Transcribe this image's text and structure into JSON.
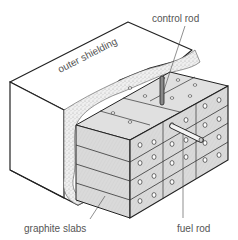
{
  "diagram": {
    "labels": {
      "control_rod": "control rod",
      "outer_shielding": "outer shielding",
      "graphite_slabs": "graphite slabs",
      "fuel_rod": "fuel rod"
    },
    "colors": {
      "outline": "#222222",
      "graphite": "#dcdcdc",
      "graphite_side": "#cfcfcf",
      "shielding_fill": "#ffffff",
      "concrete_speckle": "#e8e8e8",
      "label_text": "#555555",
      "control_rod": "#777777",
      "fuel_rod": "#f4f4f4"
    }
  }
}
